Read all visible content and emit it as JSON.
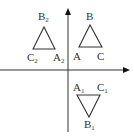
{
  "diagram": {
    "type": "coordinate-plane-triangles",
    "axes": {
      "x_axis": {
        "from": [
          0,
          70
        ],
        "to": [
          130,
          70
        ],
        "arrow": "right"
      },
      "y_axis": {
        "from": [
          68,
          132
        ],
        "to": [
          68,
          8
        ],
        "arrow": "up"
      }
    },
    "triangles": [
      {
        "name": "ABC",
        "points": {
          "A": [
            79,
            47
          ],
          "B": [
            90,
            25
          ],
          "C": [
            102,
            47
          ]
        },
        "labels": [
          {
            "text": "B",
            "sub": "",
            "pos": [
              86,
              20
            ]
          },
          {
            "text": "A",
            "sub": "",
            "pos": [
              73,
              60
            ]
          },
          {
            "text": "C",
            "sub": "",
            "pos": [
              97,
              60
            ]
          }
        ]
      },
      {
        "name": "A2B2C2",
        "points": {
          "A2": [
            55,
            49
          ],
          "B2": [
            44,
            27
          ],
          "C2": [
            33,
            49
          ]
        },
        "labels": [
          {
            "text": "B",
            "sub": "2",
            "pos": [
              38,
              20
            ]
          },
          {
            "text": "C",
            "sub": "2",
            "pos": [
              27,
              61
            ]
          },
          {
            "text": "A",
            "sub": "2",
            "pos": [
              53,
              61
            ]
          }
        ]
      },
      {
        "name": "A1B1C1",
        "points": {
          "A1": [
            77,
            95
          ],
          "B1": [
            89,
            117
          ],
          "C1": [
            100,
            95
          ]
        },
        "labels": [
          {
            "text": "A",
            "sub": "1",
            "pos": [
              73,
              91
            ]
          },
          {
            "text": "C",
            "sub": "1",
            "pos": [
              97,
              91
            ]
          },
          {
            "text": "B",
            "sub": "1",
            "pos": [
              84,
              128
            ]
          }
        ]
      }
    ],
    "colors": {
      "stroke": "#333333",
      "background": "#ffffff"
    }
  }
}
